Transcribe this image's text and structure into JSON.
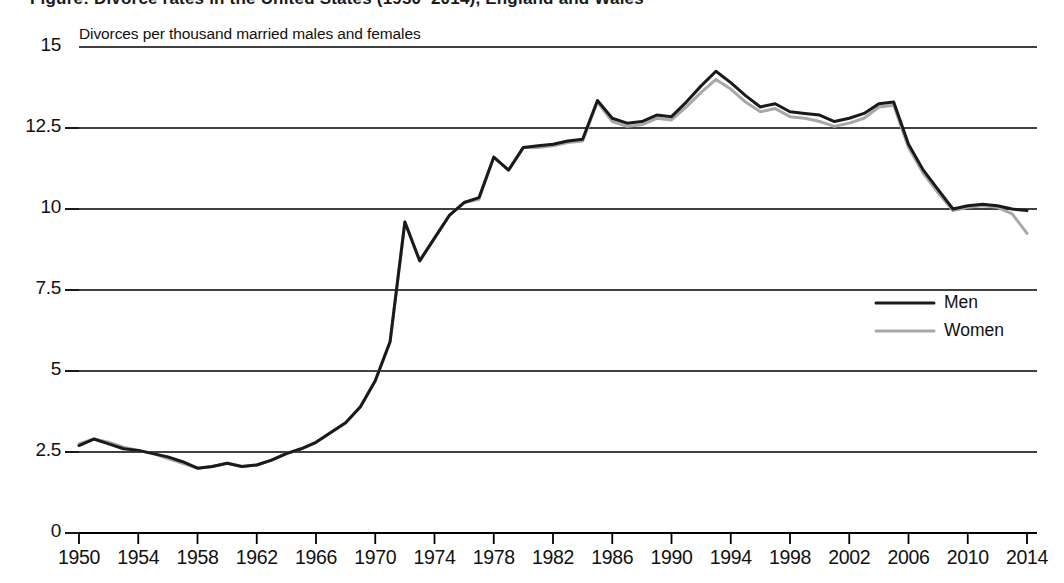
{
  "title_cutoff": "Figure: Divorce rates in the United States (1950–2014), England and Wales",
  "axis_note": "Divorces per thousand married males and females",
  "colors": {
    "men": "#1a1a1a",
    "women": "#a8a8a8",
    "axis": "#000000",
    "gridline": "#000000",
    "background": "#ffffff"
  },
  "legend": {
    "position": "right-middle",
    "entries": [
      {
        "label": "Men",
        "color": "#1a1a1a"
      },
      {
        "label": "Women",
        "color": "#a8a8a8"
      }
    ]
  },
  "yaxis": {
    "label": "",
    "ticks": [
      "0",
      "2.5",
      "5",
      "7.5",
      "10",
      "12.5",
      "15"
    ],
    "min": 0,
    "max": 15
  },
  "xaxis": {
    "label": "",
    "ticks": [
      "1950",
      "1954",
      "1958",
      "1962",
      "1966",
      "1970",
      "1974",
      "1978",
      "1982",
      "1986",
      "1990",
      "1994",
      "1998",
      "2002",
      "2006",
      "2010",
      "2014"
    ],
    "min": 1950,
    "max": 2014
  },
  "chart_data": {
    "type": "line",
    "title": "Divorces per thousand married males and females",
    "subtitle": "",
    "xlabel": "",
    "ylabel": "Divorces per thousand married males and females",
    "xlim": [
      1950,
      2014
    ],
    "ylim": [
      0,
      15
    ],
    "grid": "horizontal",
    "legend_position": "right-middle",
    "x": [
      1950,
      1951,
      1952,
      1953,
      1954,
      1955,
      1956,
      1957,
      1958,
      1959,
      1960,
      1961,
      1962,
      1963,
      1964,
      1965,
      1966,
      1967,
      1968,
      1969,
      1970,
      1971,
      1972,
      1973,
      1974,
      1975,
      1976,
      1977,
      1978,
      1979,
      1980,
      1981,
      1982,
      1983,
      1984,
      1985,
      1986,
      1987,
      1988,
      1989,
      1990,
      1991,
      1992,
      1993,
      1994,
      1995,
      1996,
      1997,
      1998,
      1999,
      2000,
      2001,
      2002,
      2003,
      2004,
      2005,
      2006,
      2007,
      2008,
      2009,
      2010,
      2011,
      2012,
      2013,
      2014
    ],
    "series": [
      {
        "name": "Men",
        "color": "#1a1a1a",
        "values": [
          2.7,
          2.9,
          2.75,
          2.6,
          2.55,
          2.45,
          2.35,
          2.2,
          2.0,
          2.05,
          2.15,
          2.05,
          2.1,
          2.25,
          2.45,
          2.6,
          2.8,
          3.1,
          3.4,
          3.9,
          4.7,
          5.9,
          9.6,
          8.4,
          9.1,
          9.8,
          10.2,
          10.35,
          11.6,
          11.2,
          11.9,
          11.95,
          12.0,
          12.1,
          12.15,
          13.35,
          12.8,
          12.65,
          12.7,
          12.9,
          12.85,
          13.3,
          13.8,
          14.25,
          13.9,
          13.5,
          13.15,
          13.25,
          13.0,
          12.95,
          12.9,
          12.7,
          12.8,
          12.95,
          13.25,
          13.3,
          12.0,
          11.2,
          10.6,
          10.0,
          10.1,
          10.15,
          10.1,
          10.0,
          9.95
        ]
      },
      {
        "name": "Women",
        "color": "#a8a8a8",
        "values": [
          2.75,
          2.9,
          2.8,
          2.65,
          2.55,
          2.45,
          2.3,
          2.15,
          2.0,
          2.05,
          2.15,
          2.05,
          2.1,
          2.25,
          2.45,
          2.6,
          2.8,
          3.1,
          3.4,
          3.9,
          4.7,
          5.9,
          9.6,
          8.4,
          9.1,
          9.8,
          10.2,
          10.3,
          11.6,
          11.2,
          11.9,
          11.9,
          11.95,
          12.05,
          12.1,
          13.3,
          12.7,
          12.55,
          12.6,
          12.8,
          12.75,
          13.15,
          13.6,
          14.0,
          13.7,
          13.3,
          13.0,
          13.1,
          12.85,
          12.8,
          12.7,
          12.55,
          12.65,
          12.8,
          13.15,
          13.2,
          11.9,
          11.1,
          10.5,
          9.95,
          10.05,
          10.1,
          10.05,
          9.85,
          9.25
        ]
      }
    ]
  },
  "geometry": {
    "plot_left": 79,
    "plot_right": 1027,
    "plot_top": 47,
    "plot_bottom": 533
  }
}
